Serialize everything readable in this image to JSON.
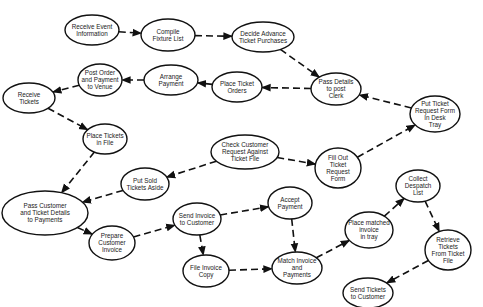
{
  "diagram": {
    "type": "activity-flow",
    "nodes": [
      {
        "id": "receive_event",
        "lines": [
          "Receive Event",
          "Information"
        ],
        "cx": 92,
        "cy": 30,
        "rx": 27,
        "ry": 15
      },
      {
        "id": "compile_fixture",
        "lines": [
          "Compile",
          "Fixture List"
        ],
        "cx": 168,
        "cy": 35,
        "rx": 27,
        "ry": 16
      },
      {
        "id": "decide_advance",
        "lines": [
          "Decide Advance",
          "Ticket Purchases"
        ],
        "cx": 263,
        "cy": 37,
        "rx": 31,
        "ry": 15
      },
      {
        "id": "post_order",
        "lines": [
          "Post Order",
          "and Payment",
          "to Venue"
        ],
        "cx": 100,
        "cy": 80,
        "rx": 22,
        "ry": 16
      },
      {
        "id": "arrange_payment",
        "lines": [
          "Arrange",
          "Payment"
        ],
        "cx": 171,
        "cy": 80,
        "rx": 27,
        "ry": 15
      },
      {
        "id": "place_ticket_orders",
        "lines": [
          "Place Ticket",
          "Orders"
        ],
        "cx": 237,
        "cy": 87,
        "rx": 25,
        "ry": 15
      },
      {
        "id": "pass_details_clerk",
        "lines": [
          "Pass Details",
          "to post",
          "Clerk"
        ],
        "cx": 336,
        "cy": 89,
        "rx": 25,
        "ry": 16
      },
      {
        "id": "receive_tickets",
        "lines": [
          "Receive",
          "Tickets"
        ],
        "cx": 29,
        "cy": 98,
        "rx": 26,
        "ry": 15
      },
      {
        "id": "put_ticket_request",
        "lines": [
          "Put Ticket",
          "Request Form",
          "In Desk",
          "Tray"
        ],
        "cx": 435,
        "cy": 114,
        "rx": 25,
        "ry": 18
      },
      {
        "id": "place_tickets_file",
        "lines": [
          "Place Tickets",
          "in File"
        ],
        "cx": 105,
        "cy": 139,
        "rx": 22,
        "ry": 15
      },
      {
        "id": "check_customer",
        "lines": [
          "Check Customer",
          "Request Against",
          "Ticket File"
        ],
        "cx": 245,
        "cy": 152,
        "rx": 34,
        "ry": 17
      },
      {
        "id": "fill_out_form",
        "lines": [
          "Fill Out",
          "Ticket",
          "Request",
          "Form"
        ],
        "cx": 338,
        "cy": 168,
        "rx": 23,
        "ry": 20
      },
      {
        "id": "put_sold_aside",
        "lines": [
          "Put Sold",
          "Tickets Aside"
        ],
        "cx": 145,
        "cy": 184,
        "rx": 24,
        "ry": 16
      },
      {
        "id": "collect_despatch",
        "lines": [
          "Collect",
          "Despatch",
          "List"
        ],
        "cx": 418,
        "cy": 186,
        "rx": 22,
        "ry": 16
      },
      {
        "id": "pass_customer",
        "lines": [
          "Pass Customer",
          "and Ticket Details",
          "to Payments"
        ],
        "cx": 45,
        "cy": 213,
        "rx": 43,
        "ry": 22
      },
      {
        "id": "accept_payment",
        "lines": [
          "Accept",
          "Payment"
        ],
        "cx": 290,
        "cy": 203,
        "rx": 22,
        "ry": 16
      },
      {
        "id": "send_invoice",
        "lines": [
          "Send Invoice",
          "to Customer"
        ],
        "cx": 197,
        "cy": 219,
        "rx": 24,
        "ry": 16
      },
      {
        "id": "prepare_invoice",
        "lines": [
          "Prepare",
          "Customer",
          "Invoice"
        ],
        "cx": 112,
        "cy": 243,
        "rx": 23,
        "ry": 17
      },
      {
        "id": "place_matched",
        "lines": [
          "Place matched",
          "invoice",
          "in tray"
        ],
        "cx": 369,
        "cy": 230,
        "rx": 24,
        "ry": 18
      },
      {
        "id": "retrieve_tickets",
        "lines": [
          "Retrieve",
          "Tickets",
          "From Ticket",
          "File"
        ],
        "cx": 448,
        "cy": 250,
        "rx": 23,
        "ry": 20
      },
      {
        "id": "file_invoice",
        "lines": [
          "File Invoice",
          "Copy"
        ],
        "cx": 206,
        "cy": 271,
        "rx": 23,
        "ry": 16
      },
      {
        "id": "match_invoice",
        "lines": [
          "Match Invoice",
          "and",
          "Payments"
        ],
        "cx": 297,
        "cy": 268,
        "rx": 25,
        "ry": 16
      },
      {
        "id": "send_tickets",
        "lines": [
          "Send Tickets",
          "to Customer"
        ],
        "cx": 368,
        "cy": 293,
        "rx": 25,
        "ry": 15
      }
    ],
    "edges": [
      {
        "from": "receive_event",
        "to": "compile_fixture"
      },
      {
        "from": "compile_fixture",
        "to": "decide_advance"
      },
      {
        "from": "decide_advance",
        "to": "pass_details_clerk"
      },
      {
        "from": "pass_details_clerk",
        "to": "place_ticket_orders"
      },
      {
        "from": "place_ticket_orders",
        "to": "arrange_payment"
      },
      {
        "from": "arrange_payment",
        "to": "post_order"
      },
      {
        "from": "post_order",
        "to": "receive_tickets"
      },
      {
        "from": "receive_tickets",
        "to": "place_tickets_file"
      },
      {
        "from": "place_tickets_file",
        "to": "pass_customer"
      },
      {
        "from": "put_ticket_request",
        "to": "pass_details_clerk"
      },
      {
        "from": "fill_out_form",
        "to": "put_ticket_request"
      },
      {
        "from": "check_customer",
        "to": "fill_out_form"
      },
      {
        "from": "check_customer",
        "to": "put_sold_aside"
      },
      {
        "from": "put_sold_aside",
        "to": "pass_customer"
      },
      {
        "from": "pass_customer",
        "to": "prepare_invoice"
      },
      {
        "from": "prepare_invoice",
        "to": "send_invoice"
      },
      {
        "from": "send_invoice",
        "to": "accept_payment"
      },
      {
        "from": "send_invoice",
        "to": "file_invoice"
      },
      {
        "from": "file_invoice",
        "to": "match_invoice"
      },
      {
        "from": "accept_payment",
        "to": "match_invoice"
      },
      {
        "from": "match_invoice",
        "to": "place_matched"
      },
      {
        "from": "place_matched",
        "to": "collect_despatch"
      },
      {
        "from": "collect_despatch",
        "to": "retrieve_tickets"
      },
      {
        "from": "retrieve_tickets",
        "to": "send_tickets"
      }
    ]
  },
  "colors": {
    "stroke": "#111111",
    "background": "#ffffff",
    "text": "#222222"
  }
}
